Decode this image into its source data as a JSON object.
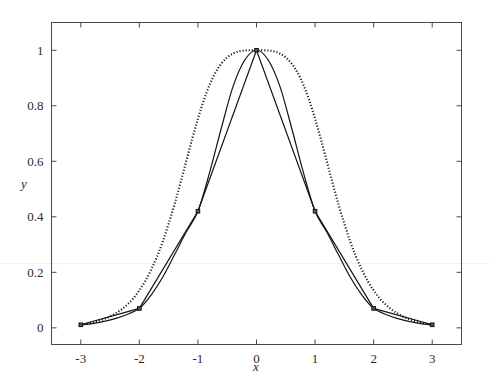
{
  "figure": {
    "background_color": "#ffffff",
    "axes_color": "#4a4a4a",
    "curve_color": "#141414",
    "marker_fill": "#555555"
  },
  "chart_data": {
    "type": "line",
    "title": "",
    "subtitle": "",
    "xlabel": "x",
    "ylabel": "y",
    "xlim": [
      -3.5,
      3.5
    ],
    "ylim": [
      -0.06,
      1.1
    ],
    "grid": false,
    "legend": "none",
    "xticks": [
      -3,
      -2,
      -1,
      0,
      1,
      2,
      3
    ],
    "xticklabels": [
      "-3",
      "-2",
      "-1",
      "0",
      "1",
      "2",
      "3"
    ],
    "yticks": [
      0,
      0.2,
      0.4,
      0.6,
      0.8,
      1
    ],
    "yticklabels": [
      "0",
      "0.2",
      "0.4",
      "0.6",
      "0.8",
      "1"
    ],
    "nodes": {
      "x": [
        -3,
        -2,
        -1,
        0,
        1,
        2,
        3
      ],
      "y": [
        0.011,
        0.07,
        0.42,
        1.0,
        0.42,
        0.07,
        0.011
      ],
      "marker": "square"
    },
    "series": [
      {
        "name": "original function (dotted)",
        "style": "dotted",
        "x": [
          -3.0,
          -2.9,
          -2.8,
          -2.7,
          -2.6,
          -2.5,
          -2.4,
          -2.3,
          -2.2,
          -2.1,
          -2.0,
          -1.9,
          -1.8,
          -1.7,
          -1.6,
          -1.5,
          -1.4,
          -1.3,
          -1.2,
          -1.1,
          -1.0,
          -0.9,
          -0.8,
          -0.7,
          -0.6,
          -0.5,
          -0.4,
          -0.3,
          -0.2,
          -0.1,
          0.0,
          0.1,
          0.2,
          0.3,
          0.4,
          0.5,
          0.6,
          0.7,
          0.8,
          0.9,
          1.0,
          1.1,
          1.2,
          1.3,
          1.4,
          1.5,
          1.6,
          1.7,
          1.8,
          1.9,
          2.0,
          2.1,
          2.2,
          2.3,
          2.4,
          2.5,
          2.6,
          2.7,
          2.8,
          2.9,
          3.0
        ],
        "y": [
          0.011,
          0.015,
          0.019,
          0.025,
          0.032,
          0.041,
          0.053,
          0.067,
          0.085,
          0.107,
          0.135,
          0.168,
          0.209,
          0.256,
          0.311,
          0.375,
          0.445,
          0.521,
          0.6,
          0.679,
          0.753,
          0.82,
          0.876,
          0.92,
          0.952,
          0.974,
          0.988,
          0.996,
          0.999,
          1.0,
          1.0,
          1.0,
          0.999,
          0.996,
          0.988,
          0.974,
          0.952,
          0.92,
          0.876,
          0.82,
          0.753,
          0.679,
          0.6,
          0.521,
          0.445,
          0.375,
          0.311,
          0.256,
          0.209,
          0.168,
          0.135,
          0.107,
          0.085,
          0.067,
          0.053,
          0.041,
          0.032,
          0.025,
          0.019,
          0.015,
          0.011
        ]
      },
      {
        "name": "spline interpolant (smooth)",
        "style": "solid",
        "x": [
          -3.0,
          -2.8,
          -2.6,
          -2.4,
          -2.2,
          -2.0,
          -1.8,
          -1.6,
          -1.4,
          -1.2,
          -1.0,
          -0.8,
          -0.6,
          -0.4,
          -0.2,
          0.0,
          0.2,
          0.4,
          0.6,
          0.8,
          1.0,
          1.2,
          1.4,
          1.6,
          1.8,
          2.0,
          2.2,
          2.4,
          2.6,
          2.8,
          3.0
        ],
        "y": [
          0.011,
          0.015,
          0.023,
          0.034,
          0.049,
          0.07,
          0.118,
          0.183,
          0.263,
          0.345,
          0.42,
          0.56,
          0.72,
          0.87,
          0.965,
          1.0,
          0.965,
          0.87,
          0.72,
          0.56,
          0.42,
          0.345,
          0.263,
          0.183,
          0.118,
          0.07,
          0.049,
          0.034,
          0.023,
          0.015,
          0.011
        ]
      },
      {
        "name": "piecewise linear interpolant",
        "style": "solid",
        "x": [
          -3,
          -2,
          -1,
          0,
          1,
          2,
          3
        ],
        "y": [
          0.011,
          0.07,
          0.42,
          1.0,
          0.42,
          0.07,
          0.011
        ]
      }
    ]
  }
}
